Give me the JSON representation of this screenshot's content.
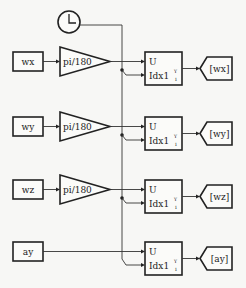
{
  "diagram": {
    "type": "simulink-block-diagram",
    "clock": {
      "label": "clock",
      "icon": "clock-icon"
    },
    "rows": [
      {
        "from_tag": "wx",
        "gain": "pi/180",
        "selector_in1": "U",
        "selector_in2": "Idx1",
        "selector_sup": "Y",
        "selector_sub": "1",
        "goto_tag": "[wx]",
        "has_gain": true
      },
      {
        "from_tag": "wy",
        "gain": "pi/180",
        "selector_in1": "U",
        "selector_in2": "Idx1",
        "selector_sup": "Y",
        "selector_sub": "1",
        "goto_tag": "[wy]",
        "has_gain": true
      },
      {
        "from_tag": "wz",
        "gain": "pi/180",
        "selector_in1": "U",
        "selector_in2": "Idx1",
        "selector_sup": "Y",
        "selector_sub": "1",
        "goto_tag": "[wz]",
        "has_gain": true
      },
      {
        "from_tag": "ay",
        "gain": "",
        "selector_in1": "U",
        "selector_in2": "Idx1",
        "selector_sup": "Y",
        "selector_sub": "1",
        "goto_tag": "[ay]",
        "has_gain": false
      }
    ],
    "colors": {
      "line": "#222222",
      "background": "#f7f7f5",
      "block_fill": "#fbfbf9"
    }
  }
}
